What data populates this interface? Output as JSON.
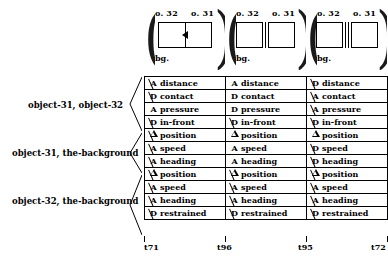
{
  "figure": {
    "scenes": [
      {
        "name": "scene-1",
        "left_object": "o. 32",
        "right_object": "o. 31",
        "background_label": "bg.",
        "relation": "touching-with-arrow"
      },
      {
        "name": "scene-2",
        "left_object": "o. 32",
        "right_object": "o. 31",
        "background_label": "bg.",
        "relation": "single-bar-gap"
      },
      {
        "name": "scene-3",
        "left_object": "o. 32",
        "right_object": "o. 31",
        "background_label": "bg.",
        "relation": "double-bar-gap"
      }
    ],
    "group_labels": [
      "object-31, object-32",
      "object-31, the-background",
      "object-32, the-background"
    ],
    "symbols": {
      "A": "A",
      "D": "D",
      "triangle": "triangle",
      "negated_suffix": "negated"
    },
    "rows": [
      {
        "group": 0,
        "property": "distance",
        "cells": [
          {
            "symbol": "A",
            "negated": true
          },
          {
            "symbol": "A",
            "negated": false
          },
          {
            "symbol": "D",
            "negated": true
          }
        ]
      },
      {
        "group": 0,
        "property": "contact",
        "cells": [
          {
            "symbol": "D",
            "negated": true
          },
          {
            "symbol": "D",
            "negated": false
          },
          {
            "symbol": "A",
            "negated": true
          }
        ]
      },
      {
        "group": 0,
        "property": "pressure",
        "cells": [
          {
            "symbol": "A",
            "negated": false
          },
          {
            "symbol": "D",
            "negated": false
          },
          {
            "symbol": "A",
            "negated": true
          }
        ]
      },
      {
        "group": 0,
        "property": "in-front",
        "cells": [
          {
            "symbol": "D",
            "negated": true
          },
          {
            "symbol": "D",
            "negated": true
          },
          {
            "symbol": "D",
            "negated": true
          }
        ]
      },
      {
        "group": 1,
        "property": "position",
        "cells": [
          {
            "symbol": "triangle",
            "negated": true
          },
          {
            "symbol": "triangle",
            "negated": false
          },
          {
            "symbol": "triangle",
            "negated": false
          }
        ]
      },
      {
        "group": 1,
        "property": "speed",
        "cells": [
          {
            "symbol": "A",
            "negated": true
          },
          {
            "symbol": "A",
            "negated": false
          },
          {
            "symbol": "D",
            "negated": true
          }
        ]
      },
      {
        "group": 1,
        "property": "heading",
        "cells": [
          {
            "symbol": "A",
            "negated": true
          },
          {
            "symbol": "A",
            "negated": false
          },
          {
            "symbol": "D",
            "negated": true
          }
        ]
      },
      {
        "group": 2,
        "property": "position",
        "cells": [
          {
            "symbol": "triangle",
            "negated": true
          },
          {
            "symbol": "triangle",
            "negated": true
          },
          {
            "symbol": "triangle",
            "negated": true
          }
        ]
      },
      {
        "group": 2,
        "property": "speed",
        "cells": [
          {
            "symbol": "A",
            "negated": true
          },
          {
            "symbol": "A",
            "negated": true
          },
          {
            "symbol": "A",
            "negated": true
          }
        ]
      },
      {
        "group": 2,
        "property": "heading",
        "cells": [
          {
            "symbol": "A",
            "negated": true
          },
          {
            "symbol": "A",
            "negated": true
          },
          {
            "symbol": "A",
            "negated": true
          }
        ]
      },
      {
        "group": 2,
        "property": "restrained",
        "cells": [
          {
            "symbol": "D",
            "negated": true
          },
          {
            "symbol": "D",
            "negated": true
          },
          {
            "symbol": "D",
            "negated": true
          }
        ]
      }
    ],
    "timeline": {
      "ticks": [
        "t71",
        "t96",
        "t95",
        "t72"
      ]
    }
  }
}
